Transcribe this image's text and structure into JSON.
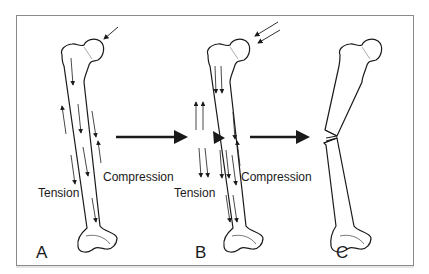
{
  "figure": {
    "panels": [
      {
        "id": "A",
        "label": "A",
        "tension_label": "Tension",
        "compression_label": "Compression"
      },
      {
        "id": "B",
        "label": "B",
        "tension_label": "Tension",
        "compression_label": "Compression"
      },
      {
        "id": "C",
        "label": "C"
      }
    ],
    "colors": {
      "line": "#1a1a1a",
      "frame": "#8a8a8a",
      "background": "#ffffff"
    }
  }
}
